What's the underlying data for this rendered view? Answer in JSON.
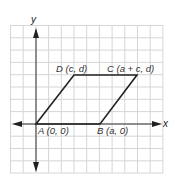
{
  "diagram": {
    "type": "coordinate-plane-parallelogram",
    "axes": {
      "x_label": "x",
      "y_label": "y"
    },
    "grid": {
      "columns": 12,
      "rows": 12,
      "line_color": "#d4d4d4"
    },
    "colors": {
      "axis": "#333333",
      "shape": "#222222",
      "text": "#333333"
    },
    "vertices": [
      {
        "name": "A",
        "label": "A (0, 0)"
      },
      {
        "name": "B",
        "label": "B (a, 0)"
      },
      {
        "name": "C",
        "label": "C (a + c, d)"
      },
      {
        "name": "D",
        "label": "D (c, d)"
      }
    ]
  }
}
